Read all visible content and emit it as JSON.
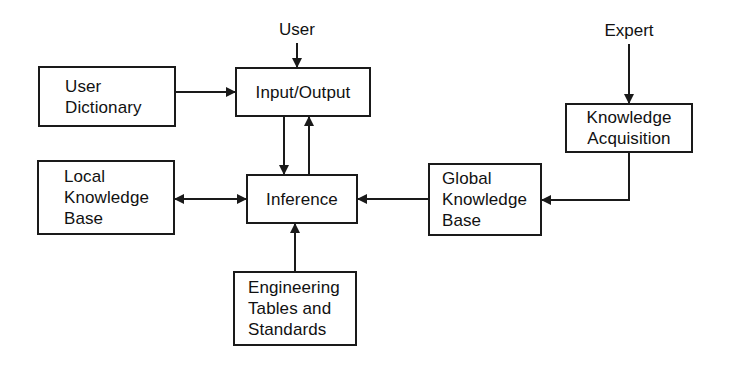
{
  "diagram": {
    "type": "block-flow",
    "stroke_color": "#1a1a1a",
    "background_color": "#ffffff",
    "external_inputs": [
      {
        "id": "user",
        "label": "User",
        "target": "input_output"
      },
      {
        "id": "expert",
        "label": "Expert",
        "target": "knowledge_acquisition"
      }
    ],
    "nodes": [
      {
        "id": "user_dictionary",
        "label": "User\nDictionary"
      },
      {
        "id": "input_output",
        "label": "Input/Output"
      },
      {
        "id": "local_kb",
        "label": "Local\nKnowledge\nBase"
      },
      {
        "id": "inference",
        "label": "Inference"
      },
      {
        "id": "global_kb",
        "label": "Global\nKnowledge\nBase"
      },
      {
        "id": "knowledge_acquisition",
        "label": "Knowledge\nAcquisition"
      },
      {
        "id": "engineering_tables",
        "label": "Engineering\nTables and\nStandards"
      }
    ],
    "edges": [
      {
        "from": "User",
        "to": "Input/Output",
        "direction": "one-way"
      },
      {
        "from": "User Dictionary",
        "to": "Input/Output",
        "direction": "one-way"
      },
      {
        "from": "Input/Output",
        "to": "Inference",
        "direction": "one-way"
      },
      {
        "from": "Inference",
        "to": "Input/Output",
        "direction": "one-way"
      },
      {
        "from": "Local Knowledge Base",
        "to": "Inference",
        "direction": "two-way"
      },
      {
        "from": "Global Knowledge Base",
        "to": "Inference",
        "direction": "one-way"
      },
      {
        "from": "Engineering Tables and Standards",
        "to": "Inference",
        "direction": "one-way"
      },
      {
        "from": "Expert",
        "to": "Knowledge Acquisition",
        "direction": "one-way"
      },
      {
        "from": "Knowledge Acquisition",
        "to": "Global Knowledge Base",
        "direction": "one-way"
      }
    ]
  }
}
